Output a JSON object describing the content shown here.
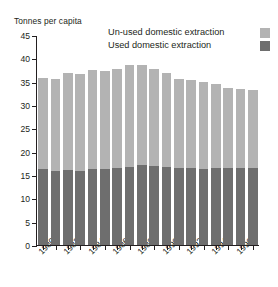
{
  "chart_data": {
    "type": "bar",
    "subtype": "stacked-bar",
    "title": "",
    "ylabel": "Tonnes per capita",
    "xlabel": "",
    "ylim": [
      0,
      45
    ],
    "yticks": [
      0,
      5,
      10,
      15,
      20,
      25,
      30,
      35,
      40,
      45
    ],
    "grid": false,
    "legend_position": "top-right",
    "categories": [
      "1980",
      "1981",
      "1982",
      "1983",
      "1984",
      "1985",
      "1986",
      "1987",
      "1988",
      "1989",
      "1990",
      "1991",
      "1992",
      "1993",
      "1994",
      "1995",
      "1996",
      "1997"
    ],
    "xtick_labels": [
      "1980",
      "1982",
      "1984",
      "1986",
      "1988",
      "1990",
      "1992",
      "1994",
      "1996"
    ],
    "series": [
      {
        "name": "Used domestic extraction",
        "color": "#6e6e6e",
        "values": [
          16.3,
          15.9,
          16.1,
          15.8,
          16.2,
          16.3,
          16.4,
          16.8,
          17.1,
          16.9,
          16.8,
          16.5,
          16.4,
          16.3,
          16.4,
          16.5,
          16.5,
          16.4
        ]
      },
      {
        "name": "Un-used domestic extraction",
        "color": "#b3b3b3",
        "values": [
          19.5,
          19.6,
          20.7,
          20.9,
          21.2,
          21.0,
          21.3,
          21.7,
          21.4,
          20.9,
          20.0,
          19.1,
          18.9,
          18.6,
          18.1,
          17.2,
          17.0,
          16.8
        ]
      }
    ],
    "totals": [
      35.8,
      35.5,
      36.8,
      36.7,
      37.4,
      37.3,
      37.7,
      38.5,
      38.5,
      37.8,
      36.8,
      35.6,
      35.3,
      34.9,
      34.5,
      33.7,
      33.5,
      33.2
    ]
  },
  "legend": {
    "items": [
      {
        "label": "Un-used domestic extraction",
        "color": "#b3b3b3"
      },
      {
        "label": "Used domestic extraction",
        "color": "#6e6e6e"
      }
    ]
  },
  "axis": {
    "y_title": "Tonnes per capita"
  }
}
